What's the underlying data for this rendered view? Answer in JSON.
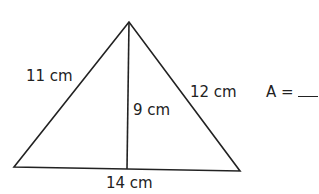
{
  "diagram": {
    "type": "triangle-area",
    "labels": {
      "left_side": "11 cm",
      "right_side": "12 cm",
      "height": "9 cm",
      "base": "14 cm"
    },
    "answer_prompt": "A =",
    "stroke_color": "#222222",
    "background": "#ffffff"
  }
}
